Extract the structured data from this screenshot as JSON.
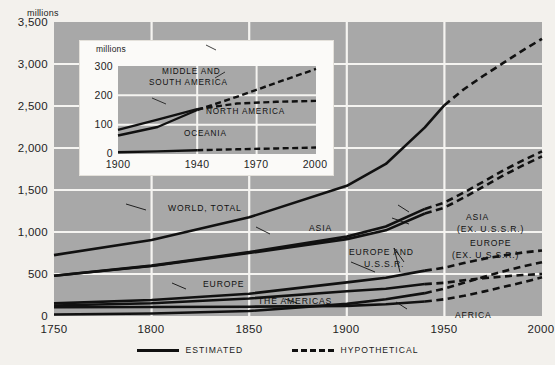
{
  "chart_data": {
    "type": "line",
    "title": "",
    "unit_label": "millions",
    "xlabel": "",
    "ylabel": "millions",
    "xlim": [
      1750,
      2000
    ],
    "ylim": [
      0,
      3500
    ],
    "xticks": [
      "1750",
      "1800",
      "1850",
      "1900",
      "1950",
      "2000"
    ],
    "yticks": [
      "0",
      "500",
      "1,000",
      "1,500",
      "2,000",
      "2,500",
      "3,000",
      "3,500"
    ],
    "grid": true,
    "legend_position": "bottom",
    "legend": [
      {
        "label": "ESTIMATED",
        "style": "solid"
      },
      {
        "label": "HYPOTHETICAL",
        "style": "dashed"
      }
    ],
    "series": [
      {
        "name": "WORLD, TOTAL",
        "estimated": {
          "x": [
            1750,
            1800,
            1850,
            1900,
            1920,
            1940,
            1950
          ],
          "y": [
            725,
            905,
            1175,
            1550,
            1810,
            2245,
            2510
          ]
        },
        "hypothetical": {
          "x": [
            1950,
            1960,
            1970,
            1980,
            1990,
            2000
          ],
          "y": [
            2510,
            2700,
            2860,
            3010,
            3160,
            3300
          ]
        }
      },
      {
        "name": "ASIA (EX. U.S.S.R.)",
        "estimated": {
          "x": [
            1750,
            1800,
            1850,
            1900,
            1920,
            1940
          ],
          "y": [
            480,
            595,
            750,
            915,
            1020,
            1220
          ]
        },
        "hypothetical": {
          "x": [
            1940,
            1950,
            1960,
            1970,
            1980,
            1990,
            2000
          ],
          "y": [
            1220,
            1290,
            1410,
            1540,
            1670,
            1790,
            1900
          ]
        }
      },
      {
        "name": "ASIA",
        "estimated": {
          "x": [
            1750,
            1800,
            1850,
            1900,
            1920,
            1940
          ],
          "y": [
            480,
            600,
            760,
            945,
            1065,
            1275
          ]
        },
        "hypothetical": {
          "x": [
            1940,
            1950,
            1960,
            1970,
            1980,
            1990,
            2000
          ],
          "y": [
            1275,
            1350,
            1470,
            1600,
            1730,
            1850,
            1960
          ]
        }
      },
      {
        "name": "EUROPE AND U.S.S.R.",
        "estimated": {
          "x": [
            1750,
            1800,
            1850,
            1900,
            1920,
            1940
          ],
          "y": [
            150,
            190,
            265,
            400,
            455,
            540
          ]
        },
        "hypothetical": {
          "x": [
            1940,
            1950,
            1960,
            1970,
            1980,
            1990,
            2000
          ],
          "y": [
            540,
            575,
            630,
            680,
            720,
            755,
            780
          ]
        }
      },
      {
        "name": "EUROPE (EX. U.S.S.R.)",
        "estimated": {
          "x": [
            1750,
            1800,
            1850,
            1900,
            1920,
            1940
          ],
          "y": [
            125,
            152,
            208,
            295,
            325,
            380
          ]
        },
        "hypothetical": {
          "x": [
            1940,
            1950,
            1960,
            1970,
            1980,
            1990,
            2000
          ],
          "y": [
            380,
            395,
            425,
            450,
            470,
            488,
            500
          ]
        }
      },
      {
        "name": "THE AMERICAS",
        "estimated": {
          "x": [
            1750,
            1800,
            1850,
            1900,
            1920,
            1940
          ],
          "y": [
            18,
            30,
            59,
            144,
            200,
            272
          ]
        },
        "hypothetical": {
          "x": [
            1940,
            1950,
            1960,
            1970,
            1980,
            1990,
            2000
          ],
          "y": [
            272,
            325,
            395,
            465,
            530,
            590,
            640
          ]
        }
      },
      {
        "name": "AFRICA",
        "estimated": {
          "x": [
            1750,
            1800,
            1850,
            1900,
            1920,
            1940
          ],
          "y": [
            105,
            107,
            111,
            120,
            140,
            172
          ]
        },
        "hypothetical": {
          "x": [
            1940,
            1950,
            1960,
            1970,
            1980,
            1990,
            2000
          ],
          "y": [
            172,
            199,
            240,
            290,
            345,
            400,
            460
          ]
        }
      }
    ],
    "labels": [
      {
        "text": "WORLD, TOTAL",
        "anchor": "series"
      },
      {
        "text": "ASIA",
        "anchor": "series"
      },
      {
        "text": "ASIA",
        "anchor": "series"
      },
      {
        "text": "(EX. U.S.S.R.)",
        "anchor": "series"
      },
      {
        "text": "EUROPE AND",
        "anchor": "series"
      },
      {
        "text": "U.S.S.R.",
        "anchor": "series"
      },
      {
        "text": "EUROPE",
        "anchor": "series"
      },
      {
        "text": "(EX. U.S.S.R.)",
        "anchor": "series"
      },
      {
        "text": "EUROPE",
        "anchor": "series"
      },
      {
        "text": "THE AMERICAS",
        "anchor": "series"
      },
      {
        "text": "AFRICA",
        "anchor": "series"
      }
    ]
  },
  "inset_chart_data": {
    "type": "line",
    "unit_label": "millions",
    "xlim": [
      1900,
      2000
    ],
    "ylim": [
      0,
      300
    ],
    "xticks": [
      "1900",
      "1940",
      "1970",
      "2000"
    ],
    "yticks": [
      "0",
      "100",
      "200",
      "300"
    ],
    "grid": true,
    "series": [
      {
        "name": "MIDDLE AND SOUTH AMERICA",
        "estimated": {
          "x": [
            1900,
            1920,
            1940
          ],
          "y": [
            63,
            92,
            150
          ]
        },
        "hypothetical": {
          "x": [
            1940,
            1960,
            1980,
            2000
          ],
          "y": [
            150,
            195,
            243,
            290
          ]
        }
      },
      {
        "name": "NORTH AMERICA",
        "estimated": {
          "x": [
            1900,
            1920,
            1940
          ],
          "y": [
            82,
            117,
            153
          ]
        },
        "hypothetical": {
          "x": [
            1940,
            1960,
            1980,
            2000
          ],
          "y": [
            153,
            172,
            178,
            181
          ]
        }
      },
      {
        "name": "OCEANIA",
        "estimated": {
          "x": [
            1900,
            1920,
            1940
          ],
          "y": [
            6,
            9,
            13
          ]
        },
        "hypothetical": {
          "x": [
            1940,
            1960,
            1980,
            2000
          ],
          "y": [
            13,
            16,
            19,
            22
          ]
        }
      }
    ],
    "labels": [
      {
        "text": "MIDDLE AND"
      },
      {
        "text": "SOUTH AMERICA"
      },
      {
        "text": "NORTH AMERICA"
      },
      {
        "text": "OCEANIA"
      }
    ]
  },
  "main_axis": {
    "unit": "millions",
    "yticks": [
      "3,500",
      "3,000",
      "2,500",
      "2,000",
      "1,500",
      "1,000",
      "500",
      "0"
    ],
    "xticks": [
      "1750",
      "1800",
      "1850",
      "1900",
      "1950",
      "2000"
    ]
  },
  "inset_axis": {
    "unit": "millions",
    "yticks": [
      "300",
      "200",
      "100",
      "0"
    ],
    "xticks": [
      "1900",
      "1940",
      "1970",
      "2000"
    ]
  },
  "labels": {
    "world_total": "WORLD, TOTAL",
    "asia": "ASIA",
    "asia_ex_1": "ASIA",
    "asia_ex_2": "(EX. U.S.S.R.)",
    "europe_ussr_1": "EUROPE AND",
    "europe_ussr_2": "U.S.S.R.",
    "europe_ex_1": "EUROPE",
    "europe_ex_2": "(EX. U.S.S.R.)",
    "europe": "EUROPE",
    "americas": "THE AMERICAS",
    "africa": "AFRICA",
    "inset_msa_1": "MIDDLE AND",
    "inset_msa_2": "SOUTH AMERICA",
    "inset_na": "NORTH AMERICA",
    "inset_oceania": "OCEANIA"
  },
  "legend": {
    "estimated": "ESTIMATED",
    "hypothetical": "HYPOTHETICAL"
  },
  "colors": {
    "page_bg": "#f3f1ed",
    "plot_bg": "#a8a8a8",
    "grid": "#f5f4f1",
    "line": "#111111",
    "inset_bg": "#fbfaf8"
  }
}
